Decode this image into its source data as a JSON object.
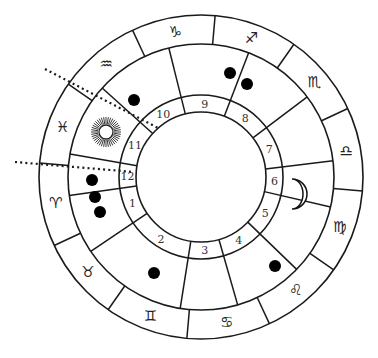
{
  "chart_type": "natal-horoscope-wheel",
  "geometry": {
    "center": [
      201,
      177
    ],
    "r_outer": 162,
    "r_zodiac_inner": 133,
    "r_house_ring_outer": 82,
    "r_inner": 65
  },
  "zodiac_signs": [
    {
      "name": "capricorn",
      "glyph": "♑",
      "angle": 100
    },
    {
      "name": "sagittarius",
      "glyph": "♐",
      "angle": 70
    },
    {
      "name": "scorpio",
      "glyph": "♏",
      "angle": 40
    },
    {
      "name": "libra",
      "glyph": "♎",
      "angle": 10
    },
    {
      "name": "virgo",
      "glyph": "♍",
      "angle": -20
    },
    {
      "name": "leo",
      "glyph": "♌",
      "angle": -50
    },
    {
      "name": "cancer",
      "glyph": "♋",
      "angle": -80
    },
    {
      "name": "gemini",
      "glyph": "♊",
      "angle": -110
    },
    {
      "name": "taurus",
      "glyph": "♉",
      "angle": -140
    },
    {
      "name": "aries",
      "glyph": "♈",
      "angle": -170
    },
    {
      "name": "pisces",
      "glyph": "♓",
      "angle": 160
    },
    {
      "name": "aquarius",
      "glyph": "♒",
      "angle": 130
    }
  ],
  "sign_dividers": [
    85,
    115,
    145,
    175,
    205,
    235,
    265,
    295,
    325,
    355,
    25,
    55
  ],
  "house_cusps": [
    188,
    214,
    261,
    286,
    316,
    347,
    7,
    37,
    69,
    104,
    138,
    170
  ],
  "houses": [
    {
      "number": "1",
      "angle": 201
    },
    {
      "number": "2",
      "angle": 237
    },
    {
      "number": "3",
      "angle": 273
    },
    {
      "number": "4",
      "angle": 301
    },
    {
      "number": "5",
      "angle": 331
    },
    {
      "number": "6",
      "angle": -3
    },
    {
      "number": "7",
      "angle": 22
    },
    {
      "number": "8",
      "angle": 53
    },
    {
      "number": "9",
      "angle": 87
    },
    {
      "number": "10",
      "angle": 121
    },
    {
      "number": "11",
      "angle": 154
    },
    {
      "number": "12",
      "angle": 179
    }
  ],
  "planets": [
    {
      "name": "planet-dot",
      "x": 134,
      "y": 100,
      "house": "10"
    },
    {
      "name": "planet-dot",
      "x": 230,
      "y": 73,
      "house": "9"
    },
    {
      "name": "planet-dot",
      "x": 247,
      "y": 84,
      "house": "8"
    },
    {
      "name": "planet-dot",
      "x": 92,
      "y": 180,
      "house": "12"
    },
    {
      "name": "planet-dot",
      "x": 95,
      "y": 197,
      "house": "1"
    },
    {
      "name": "planet-dot",
      "x": 100,
      "y": 212,
      "house": "1"
    },
    {
      "name": "planet-dot",
      "x": 154,
      "y": 273,
      "house": "2"
    },
    {
      "name": "planet-dot",
      "x": 275,
      "y": 266,
      "house": "4"
    }
  ],
  "sun": {
    "x": 106,
    "y": 132,
    "house": "11"
  },
  "moon": {
    "x": 298,
    "y": 194,
    "house": "5-6"
  },
  "dotted_lines": [
    {
      "from": [
        45,
        69
      ],
      "to": [
        160,
        129
      ],
      "label": "sun-aspect-line"
    },
    {
      "from": [
        15,
        162
      ],
      "to": [
        134,
        172
      ],
      "label": "ascendant-line"
    }
  ]
}
